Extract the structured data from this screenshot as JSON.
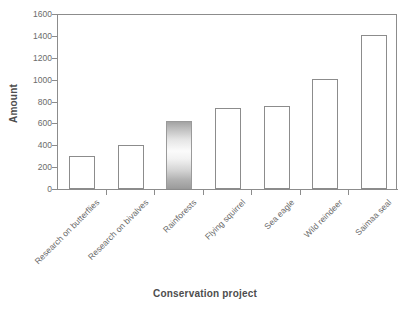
{
  "chart_data": {
    "type": "bar",
    "title": "",
    "xlabel": "Conservation project",
    "ylabel": "Amount",
    "categories": [
      "Research on butterflies",
      "Research on bivalves",
      "Rainforests",
      "Flying squirrel",
      "Sea eagle",
      "Wild reindeer",
      "Saimaa seal"
    ],
    "values": [
      300,
      400,
      625,
      740,
      760,
      1010,
      1405
    ],
    "ylim": [
      0,
      1600
    ],
    "yticks": [
      0,
      200,
      400,
      600,
      800,
      1000,
      1200,
      1400,
      1600
    ],
    "ytick_labels": [
      "0",
      "200",
      "400",
      "600",
      "800",
      "1000",
      "1200",
      "1400",
      "1600"
    ],
    "grid": false,
    "legend": null,
    "bar_style": {
      "fill": "#ffffff",
      "edge_color": "#8c8c8c",
      "highlight_index": 2,
      "highlight_fill": "vertical-gray-gradient"
    },
    "axis_color": "#8c8c8c",
    "text_color": "#6b6b6b"
  }
}
